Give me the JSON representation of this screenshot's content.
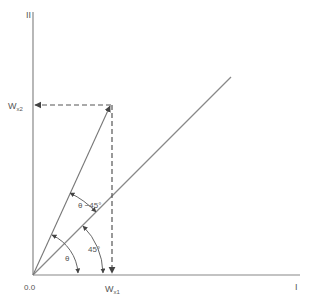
{
  "diagram": {
    "type": "vector-rotation",
    "axes": {
      "x_label": "I",
      "y_label": "II",
      "origin_label": "0.0"
    },
    "projections": {
      "x": {
        "label_main": "W",
        "label_sub": "x1"
      },
      "y": {
        "label_main": "W",
        "label_sub": "x2"
      }
    },
    "angles": {
      "theta": "θ",
      "forty_five": "45°",
      "theta_minus_45": "θ −45°"
    },
    "colors": {
      "line": "#777777",
      "text": "#555555"
    }
  }
}
